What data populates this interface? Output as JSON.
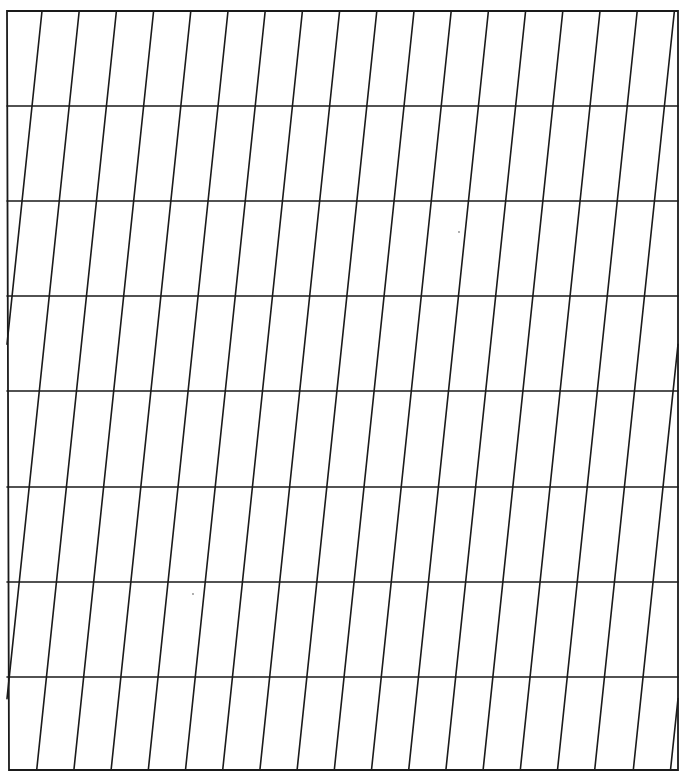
{
  "diagram": {
    "colors": {
      "background": "#ffffff",
      "line": "#1a1a1a",
      "speck": "#8a8a8a"
    },
    "frame": {
      "top_left": [
        7,
        11
      ],
      "top_right": [
        678,
        11
      ],
      "bottom_right": [
        678,
        770
      ],
      "bottom_left": [
        9,
        770
      ]
    },
    "horizontal_lines_y": [
      106,
      201,
      296,
      391,
      487,
      582,
      677
    ],
    "slanted_lines": {
      "count": 18,
      "top_x_start": 42,
      "spacing": 37.2,
      "slope_dx_per_dy": -0.105,
      "wrap": true
    },
    "specks": [
      [
        459,
        232
      ],
      [
        193,
        594
      ]
    ]
  }
}
